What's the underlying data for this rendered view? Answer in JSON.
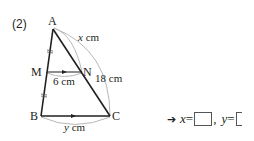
{
  "problem": {
    "number": "(2)",
    "vertices": {
      "A": "A",
      "B": "B",
      "C": "C",
      "M": "M",
      "N": "N"
    },
    "measures": {
      "AN": "x cm",
      "AN_var": "x",
      "AC": "18 cm",
      "MN": "6 cm",
      "BC_var": "y",
      "unit": "cm"
    },
    "answer": {
      "arrow": "➔",
      "x_label": "x",
      "y_label": "y",
      "equals": "=",
      "sep": ","
    }
  },
  "colors": {
    "line": "#231f20",
    "arc": "#b5b5b5"
  }
}
